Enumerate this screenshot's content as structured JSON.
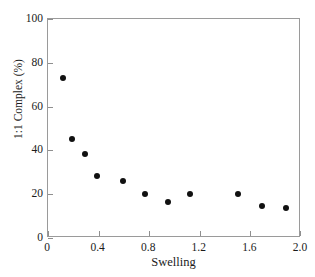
{
  "chart_data": {
    "type": "scatter",
    "title": "",
    "xlabel": "Swelling",
    "ylabel": "1:1 Complex (%)",
    "xlim": [
      0,
      2.0
    ],
    "ylim": [
      0,
      100
    ],
    "xticks": [
      "0",
      "0.4",
      "0.8",
      "1.2",
      "1.6",
      "2.0"
    ],
    "xtick_values": [
      0,
      0.4,
      0.8,
      1.2,
      1.6,
      2.0
    ],
    "yticks": [
      "0",
      "20",
      "40",
      "60",
      "80",
      "100"
    ],
    "ytick_values": [
      0,
      20,
      40,
      60,
      80,
      100
    ],
    "grid": false,
    "legend": null,
    "marker_color": "#111111",
    "frame_color": "#9a9a9a",
    "series": [
      {
        "name": "1:1 Complex",
        "x": [
          0.12,
          0.19,
          0.29,
          0.39,
          0.59,
          0.77,
          0.95,
          1.12,
          1.5,
          1.69,
          1.88
        ],
        "y": [
          73.0,
          45.0,
          38.5,
          28.5,
          26.0,
          20.0,
          16.5,
          20.0,
          20.0,
          14.5,
          13.5
        ]
      }
    ]
  }
}
